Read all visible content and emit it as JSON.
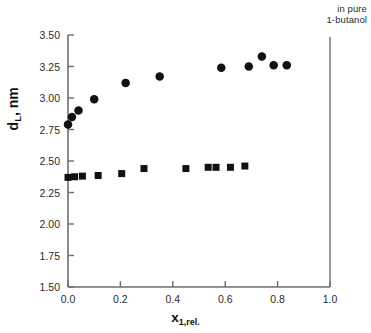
{
  "annotation": {
    "line1": "in pure",
    "line2": "1-butanol"
  },
  "chart_data": {
    "type": "scatter",
    "title": "",
    "subtitle": "",
    "xlabel": "x",
    "xlabel_sub": "1,rel.",
    "ylabel": "d",
    "ylabel_sub": "L",
    "ylabel_unit": ", nm",
    "xlim": [
      0.0,
      1.0
    ],
    "ylim": [
      1.5,
      3.5
    ],
    "xticks": [
      0.0,
      0.2,
      0.4,
      0.6,
      0.8,
      1.0
    ],
    "xticklabels": [
      "0.0",
      "0.2",
      "0.4",
      "0.6",
      "0.8",
      "1.0"
    ],
    "yticks": [
      1.5,
      1.75,
      2.0,
      2.25,
      2.5,
      2.75,
      3.0,
      3.25,
      3.5
    ],
    "yticklabels": [
      "1.50",
      "1.75",
      "2.00",
      "2.25",
      "2.50",
      "2.75",
      "3.00",
      "3.25",
      "3.50"
    ],
    "grid": false,
    "legend": "none",
    "annotations": [
      {
        "text": "in pure 1-butanol",
        "x": 1.0,
        "kind": "vertical-reference-line",
        "position": "top-right"
      }
    ],
    "series": [
      {
        "name": "circles",
        "marker": "filled-circle",
        "color": "#111111",
        "marker_size_px": 8.5,
        "points": [
          {
            "x": 0.0,
            "y": 2.79
          },
          {
            "x": 0.015,
            "y": 2.85
          },
          {
            "x": 0.04,
            "y": 2.9
          },
          {
            "x": 0.1,
            "y": 2.99
          },
          {
            "x": 0.22,
            "y": 3.12
          },
          {
            "x": 0.35,
            "y": 3.17
          },
          {
            "x": 0.585,
            "y": 3.24
          },
          {
            "x": 0.69,
            "y": 3.25
          },
          {
            "x": 0.74,
            "y": 3.33
          },
          {
            "x": 0.785,
            "y": 3.26
          },
          {
            "x": 0.835,
            "y": 3.26
          }
        ]
      },
      {
        "name": "squares",
        "marker": "filled-square",
        "color": "#111111",
        "marker_size_px": 7,
        "points": [
          {
            "x": 0.0,
            "y": 2.37
          },
          {
            "x": 0.025,
            "y": 2.375
          },
          {
            "x": 0.055,
            "y": 2.38
          },
          {
            "x": 0.115,
            "y": 2.385
          },
          {
            "x": 0.205,
            "y": 2.4
          },
          {
            "x": 0.29,
            "y": 2.44
          },
          {
            "x": 0.45,
            "y": 2.44
          },
          {
            "x": 0.535,
            "y": 2.45
          },
          {
            "x": 0.565,
            "y": 2.45
          },
          {
            "x": 0.62,
            "y": 2.45
          },
          {
            "x": 0.675,
            "y": 2.46
          }
        ]
      }
    ]
  },
  "geometry": {
    "plot_left": 68,
    "plot_right": 330,
    "plot_top": 35,
    "plot_bottom": 287,
    "ref_line_x": 330,
    "ref_line_top": 37
  },
  "colors": {
    "axis": "#6e6e6e",
    "marker": "#111111",
    "text": "#2b2b2b",
    "background": "#ffffff"
  }
}
